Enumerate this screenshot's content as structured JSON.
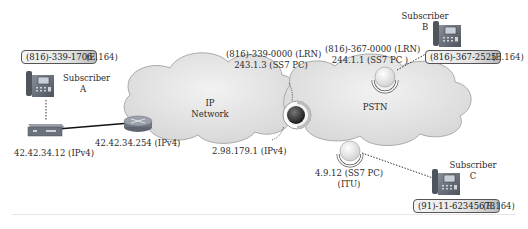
{
  "diagram": {
    "subscribers": [
      {
        "id": "A",
        "label": "Subscriber",
        "letter": "A",
        "number": "(816)-339-1706",
        "number_type": "(E.164)"
      },
      {
        "id": "B",
        "label": "Subscriber",
        "letter": "B",
        "number": "(816)-367-2525",
        "number_type": "(E.164)"
      },
      {
        "id": "C",
        "label": "Subscriber",
        "letter": "C",
        "number": "(91)-11-62345678",
        "number_type": "(E.164)"
      }
    ],
    "networks": {
      "ip": {
        "line1": "IP",
        "line2": "Network"
      },
      "pstn": {
        "line1": "PSTN"
      }
    },
    "devices": {
      "gateway": {
        "address": "42.42.34.12 (IPv4)"
      },
      "router": {
        "address": "42.42.34.254 (IPv4)"
      },
      "softswitch": {
        "lrn": "(816)-339-0000 (LRN)",
        "pc": "243.1.3 (SS7 PC)",
        "ip": "2.98.179.1 (IPv4)"
      },
      "switch_b": {
        "lrn": "(816)-367-0000 (LRN)",
        "pc": "244.1.1 (SS7 PC )"
      },
      "switch_c": {
        "pc": "4.9.12 (SS7 PC)",
        "std": "(ITU)"
      }
    }
  }
}
